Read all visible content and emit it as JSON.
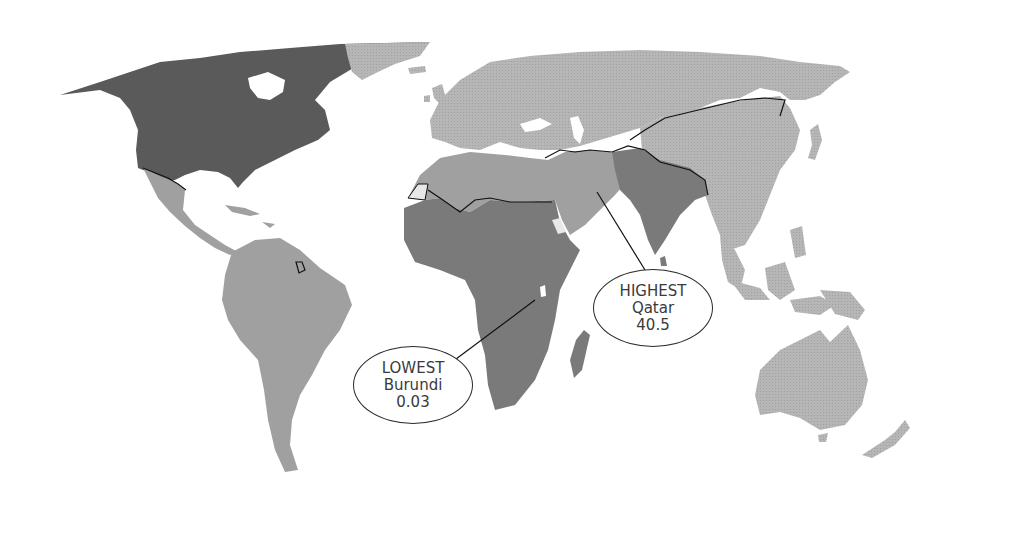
{
  "map": {
    "type": "choropleth",
    "projection": "world",
    "colors": {
      "highest_band": "#5a5a5a",
      "high_band": "#7a7a7a",
      "mid_band": "#a8a8a8",
      "low_band": "#b4b4b4",
      "no_data": "#e8e8e8",
      "border": "#111111",
      "water": "#ffffff"
    },
    "regions": [
      {
        "name": "North America (USA, Canada)",
        "band": "highest_band"
      },
      {
        "name": "Mexico, Central America & Caribbean",
        "band": "mid_band"
      },
      {
        "name": "South America",
        "band": "mid_band"
      },
      {
        "name": "Greenland",
        "band": "low_band"
      },
      {
        "name": "Europe & Russia",
        "band": "low_band"
      },
      {
        "name": "North Africa",
        "band": "mid_band"
      },
      {
        "name": "Middle East",
        "band": "mid_band"
      },
      {
        "name": "Sub-Saharan Africa",
        "band": "high_band"
      },
      {
        "name": "South Asia",
        "band": "high_band"
      },
      {
        "name": "East Asia & China",
        "band": "low_band"
      },
      {
        "name": "Southeast Asia",
        "band": "low_band"
      },
      {
        "name": "Oceania",
        "band": "low_band"
      },
      {
        "name": "Western Sahara",
        "band": "no_data"
      },
      {
        "name": "Eritrea",
        "band": "no_data"
      }
    ]
  },
  "callouts": {
    "lowest": {
      "label": "LOWEST",
      "country": "Burundi",
      "value": "0.03"
    },
    "highest": {
      "label": "HIGHEST",
      "country": "Qatar",
      "value": "40.5"
    }
  }
}
